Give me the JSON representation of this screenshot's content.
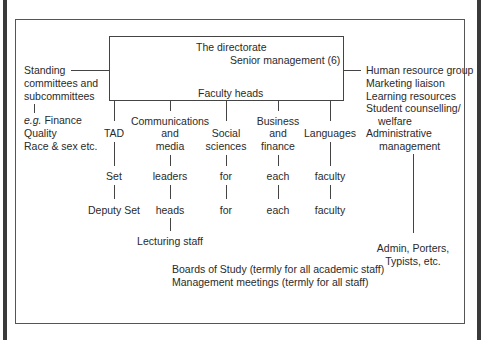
{
  "directorate": {
    "title": "The directorate",
    "senior": "Senior management (6)",
    "faculty_heads": "Faculty heads"
  },
  "left_group": {
    "lines": [
      "Standing",
      "committees and",
      "subcommittees"
    ],
    "examples_prefix": "e.g.",
    "examples": [
      "Finance",
      "Quality",
      "Race & sex etc."
    ]
  },
  "right_group": {
    "lines": [
      "Human resource group",
      "Marketing liaison",
      "Learning resources",
      "Student counselling/",
      "welfare",
      "Administrative",
      "management"
    ],
    "sub": [
      "Admin, Porters,",
      "Typists, etc."
    ]
  },
  "faculties": [
    {
      "name": [
        "TAD"
      ],
      "level1": "Set",
      "level2": "Deputy Set"
    },
    {
      "name": [
        "Communications",
        "and",
        "media"
      ],
      "level1": "leaders",
      "level2": "heads",
      "level3": "Lecturing staff"
    },
    {
      "name": [
        "Social",
        "sciences"
      ],
      "level1": "for",
      "level2": "for"
    },
    {
      "name": [
        "Business",
        "and",
        "finance"
      ],
      "level1": "each",
      "level2": "each"
    },
    {
      "name": [
        "Languages"
      ],
      "level1": "faculty",
      "level2": "faculty"
    }
  ],
  "meetings": [
    "Boards of Study (termly for all academic staff)",
    "Management meetings (termly for all staff)"
  ]
}
